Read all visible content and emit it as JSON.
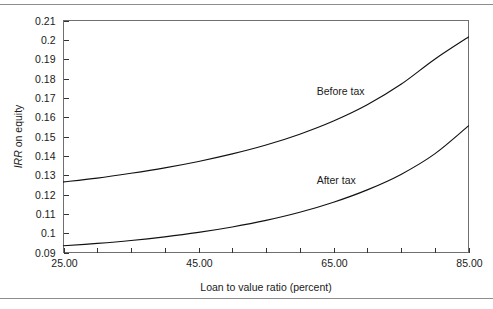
{
  "figure": {
    "background_color": "#ffffff",
    "rule_color": "#8d8d8d",
    "frame_color": "#6f6f6f",
    "curve_color": "#111111"
  },
  "chart_data": {
    "type": "line",
    "title": "",
    "xlabel": "Loan to value ratio (percent)",
    "ylabel_italic": "IRR",
    "ylabel_rest": " on equity",
    "ylabel_full": "IRR on equity",
    "xlim": [
      25.0,
      85.0
    ],
    "ylim": [
      0.09,
      0.21
    ],
    "grid": false,
    "legend_position": "inline-annotation",
    "x_ticks": [
      25,
      30,
      35,
      40,
      45,
      50,
      55,
      60,
      65,
      70,
      75,
      80,
      85
    ],
    "x_tick_labels": [
      "25.00",
      "",
      "",
      "",
      "45.00",
      "",
      "",
      "",
      "65.00",
      "",
      "",
      "",
      "85.00"
    ],
    "y_ticks": [
      0.09,
      0.1,
      0.11,
      0.12,
      0.13,
      0.14,
      0.15,
      0.16,
      0.17,
      0.18,
      0.19,
      0.2,
      0.21
    ],
    "y_tick_labels": [
      "0.09",
      "0.1",
      "0.11",
      "0.12",
      "0.13",
      "0.14",
      "0.15",
      "0.16",
      "0.17",
      "0.18",
      "0.19",
      "0.2",
      "0.21"
    ],
    "x": [
      25,
      30,
      35,
      40,
      45,
      50,
      55,
      60,
      65,
      70,
      75,
      80,
      85
    ],
    "series": [
      {
        "name": "Before tax",
        "label": "Before tax",
        "label_x": 62.5,
        "label_y": 0.1715,
        "values": [
          0.1265,
          0.1285,
          0.131,
          0.1338,
          0.1371,
          0.141,
          0.1456,
          0.1512,
          0.158,
          0.1664,
          0.177,
          0.19,
          0.2015
        ]
      },
      {
        "name": "After tax",
        "label": "After tax",
        "label_x": 62.5,
        "label_y": 0.1255,
        "values": [
          0.0935,
          0.0947,
          0.0962,
          0.0981,
          0.1004,
          0.1032,
          0.1066,
          0.1108,
          0.116,
          0.1224,
          0.1304,
          0.141,
          0.1555
        ]
      }
    ]
  }
}
